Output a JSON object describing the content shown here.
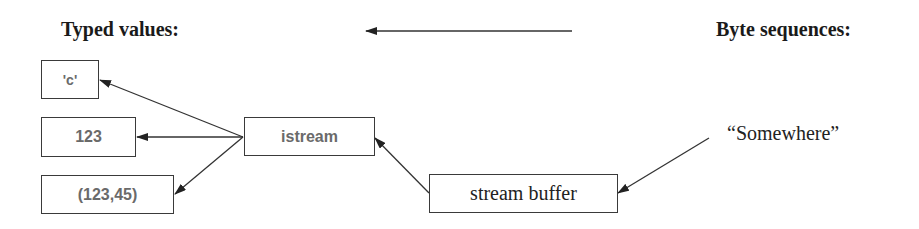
{
  "headings": {
    "left": "Typed values:",
    "right": "Byte sequences:"
  },
  "typed_values": [
    {
      "label": "'c'"
    },
    {
      "label": "123"
    },
    {
      "label": "(123,45)"
    }
  ],
  "istream": {
    "label": "istream"
  },
  "stream_buffer": {
    "label": "stream buffer"
  },
  "source": {
    "label": "“Somewhere”"
  },
  "colors": {
    "line": "#333333",
    "box_border": "#3a3a3a",
    "sans_text": "#6a6a6a",
    "serif_text": "#222222"
  },
  "edges": [
    {
      "from": "byte-sequences",
      "to": "typed-values",
      "kind": "direction-indicator"
    },
    {
      "from": "istream",
      "to": "'c'"
    },
    {
      "from": "istream",
      "to": "123"
    },
    {
      "from": "istream",
      "to": "(123,45)"
    },
    {
      "from": "stream buffer",
      "to": "istream"
    },
    {
      "from": "“Somewhere”",
      "to": "stream buffer"
    }
  ]
}
